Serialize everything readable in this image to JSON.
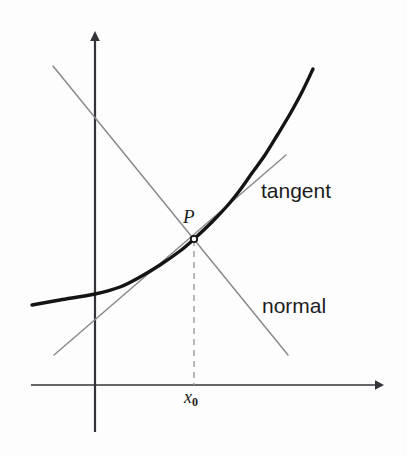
{
  "figure": {
    "background_color": "#fdfdfd",
    "width": 407,
    "height": 457
  },
  "labels": {
    "tangent": "tangent",
    "normal": "normal",
    "point": "P",
    "x_tick": "x",
    "x_tick_sub": "0"
  },
  "colors": {
    "curve": "#141414",
    "axis": "#33333a",
    "line": "#8a8a8f",
    "dashed": "#9b9b9b",
    "text": "#1c1c1c"
  },
  "chart_data": {
    "type": "line",
    "title": "",
    "xlabel": "",
    "ylabel": "",
    "grid": false,
    "legend": "none",
    "axes": {
      "x_axis": {
        "y_px": 385,
        "x_start_px": 31,
        "x_end_px": 382,
        "arrow": "right"
      },
      "y_axis": {
        "x_px": 95,
        "y_start_px": 432,
        "y_end_px": 32,
        "arrow": "up"
      }
    },
    "annotations": [
      {
        "name": "tangent",
        "text": "tangent",
        "x_px": 261,
        "y_px": 193
      },
      {
        "name": "normal",
        "text": "normal",
        "x_px": 262,
        "y_px": 308
      },
      {
        "name": "point-label",
        "text": "P",
        "x_px": 186,
        "y_px": 221
      },
      {
        "name": "x0-tick",
        "text": "x0",
        "x_px": 186,
        "y_px": 401
      }
    ],
    "series": [
      {
        "name": "curve",
        "style": "thick-solid",
        "points_px": [
          [
            32,
            305
          ],
          [
            60,
            300
          ],
          [
            95,
            294
          ],
          [
            120,
            287
          ],
          [
            140,
            277
          ],
          [
            160,
            265
          ],
          [
            180,
            251
          ],
          [
            194,
            239
          ],
          [
            212,
            222
          ],
          [
            228,
            205
          ],
          [
            240,
            190
          ],
          [
            252,
            173
          ],
          [
            265,
            155
          ],
          [
            278,
            134
          ],
          [
            290,
            114
          ],
          [
            302,
            92
          ],
          [
            313,
            69
          ]
        ]
      },
      {
        "name": "tangent-line",
        "style": "thin-solid",
        "points_px": [
          [
            54,
            355
          ],
          [
            286,
            155
          ]
        ]
      },
      {
        "name": "normal-line",
        "style": "thin-solid",
        "points_px": [
          [
            53,
            66
          ],
          [
            288,
            355
          ]
        ]
      },
      {
        "name": "dropline",
        "style": "dashed",
        "points_px": [
          [
            194,
            240
          ],
          [
            194,
            385
          ]
        ]
      }
    ],
    "markers": [
      {
        "name": "point-P",
        "x_px": 194,
        "y_px": 239,
        "shape": "circle",
        "size_px": 5
      }
    ]
  }
}
